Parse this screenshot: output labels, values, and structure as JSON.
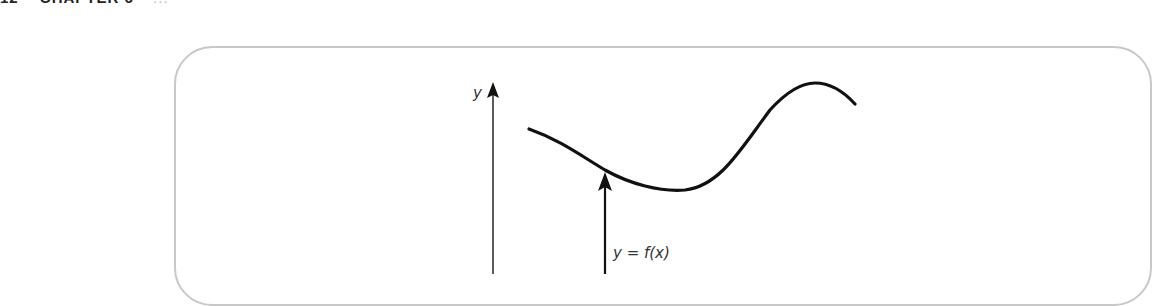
{
  "page_header": {
    "page_number": "12",
    "chapter": "CHAPTER 6",
    "rest": "..."
  },
  "diagram": {
    "axis_label_y": "y",
    "function_label": "y = f(x)",
    "elements": [
      "vertical y-axis with arrowhead",
      "smooth curve (dip then peak)",
      "vertical arrow from below pointing up to curve"
    ],
    "colors": {
      "frame": "#c8c8c8",
      "lines": "#111111",
      "axis": "#333333"
    }
  }
}
